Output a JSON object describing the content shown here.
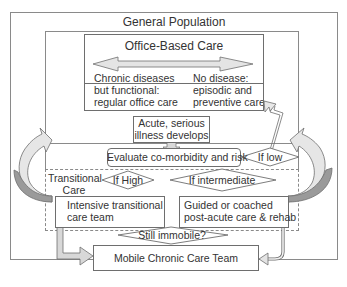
{
  "diagram": {
    "outer_title": "General Population",
    "office_box": {
      "title": "Office-Based Care",
      "left_text": [
        "Chronic diseases",
        "but functional:",
        "regular office care"
      ],
      "right_text": [
        "No disease:",
        "episodic and",
        "preventive care"
      ]
    },
    "acute_box": [
      "Acute, serious",
      "illness develops"
    ],
    "evaluate_box": "Evaluate co-morbidity and risk",
    "decisions": {
      "low": "If low",
      "high": "If High",
      "intermediate": "If intermediate",
      "immobile": "Still immobile?"
    },
    "transitional_label": [
      "Transitional",
      "Care"
    ],
    "intensive_box": [
      "Intensive transitional",
      "care team"
    ],
    "guided_box": [
      "Guided or coached",
      "post-acute care & rehab"
    ],
    "mobile_box": "Mobile Chronic Care Team",
    "colors": {
      "border": "#6e6e6e",
      "arrow_fill_light": "#e4e4e4",
      "arrow_fill_dark": "#9a9a9a",
      "text": "#333333"
    }
  }
}
